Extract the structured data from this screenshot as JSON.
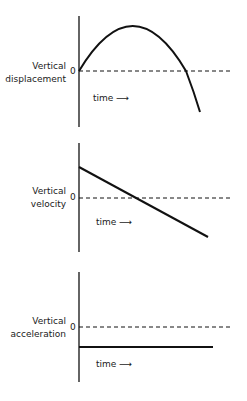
{
  "colors": {
    "ink": "#111111",
    "background": "#ffffff"
  },
  "panels": [
    {
      "id": "displacement",
      "label_line1": "Vertical",
      "label_line2": "displacement",
      "zero_label": "0",
      "time_label": "time ⟶",
      "curve_type": "parabola"
    },
    {
      "id": "velocity",
      "label_line1": "Vertical",
      "label_line2": "velocity",
      "zero_label": "0",
      "time_label": "time ⟶",
      "curve_type": "line-decreasing"
    },
    {
      "id": "acceleration",
      "label_line1": "Vertical",
      "label_line2": "acceleration",
      "zero_label": "0",
      "time_label": "time ⟶",
      "curve_type": "constant-negative"
    }
  ]
}
